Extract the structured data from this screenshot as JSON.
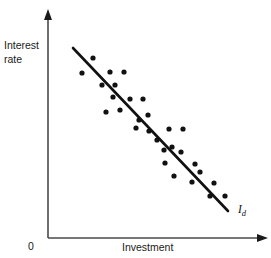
{
  "figure": {
    "background_color": "#ffffff",
    "ink_color": "#111111"
  },
  "axes": {
    "y_label_line1": "Interest",
    "y_label_line2": "rate",
    "x_label": "Investment",
    "origin_label": "0"
  },
  "annotations": {
    "curve_label_base": "I",
    "curve_label_sub": "d"
  },
  "chart_data": {
    "type": "scatter",
    "title": "",
    "xlabel": "Investment",
    "ylabel": "Interest rate",
    "grid": false,
    "legend": "none",
    "xlim": [
      0,
      100
    ],
    "ylim": [
      0,
      100
    ],
    "axis_ticks": {
      "x": [],
      "y": [],
      "origin": "0"
    },
    "series": [
      {
        "name": "observations",
        "type": "scatter",
        "marker": "filled-circle",
        "marker_size_px": 4,
        "color": "#111111",
        "points": [
          [
            93,
            58
          ],
          [
            82,
            73
          ],
          [
            110,
            72
          ],
          [
            124,
            72
          ],
          [
            102,
            85
          ],
          [
            115,
            85
          ],
          [
            113,
            97
          ],
          [
            130,
            99
          ],
          [
            143,
            99
          ],
          [
            106,
            112
          ],
          [
            148,
            115
          ],
          [
            136,
            128
          ],
          [
            149,
            131
          ],
          [
            169,
            129
          ],
          [
            183,
            129
          ],
          [
            164,
            150
          ],
          [
            172,
            147
          ],
          [
            181,
            152
          ],
          [
            165,
            163
          ],
          [
            195,
            164
          ],
          [
            174,
            176
          ],
          [
            192,
            182
          ],
          [
            214,
            183
          ],
          [
            210,
            196
          ],
          [
            120,
            110
          ],
          [
            157,
            140
          ],
          [
            200,
            172
          ],
          [
            225,
            196
          ],
          [
            139,
            120
          ]
        ],
        "points_note": "Pixel coordinates within the 271x258 figure; origin of plot at (48,238)."
      },
      {
        "name": "Id",
        "type": "line",
        "label": "I_d",
        "color": "#111111",
        "line_width_px": 2.6,
        "endpoints": [
          [
            73,
            48
          ],
          [
            228,
            211
          ]
        ],
        "slope_sign": "negative"
      }
    ]
  }
}
